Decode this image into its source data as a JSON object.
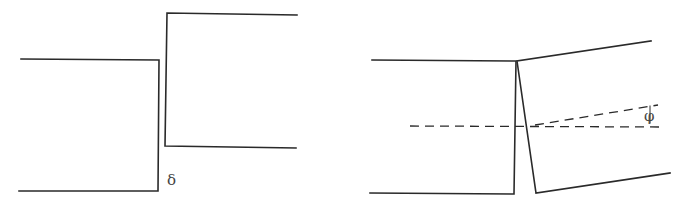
{
  "figures": [
    {
      "id": "shear-displacement",
      "label": "δ",
      "description": "Two blocks offset vertically by a shear displacement δ"
    },
    {
      "id": "rotation",
      "label": "φ",
      "description": "Right block rotated relative to left block by angle φ about the neutral axis (dashed lines)"
    }
  ],
  "colors": {
    "line": "#2a2a2a",
    "background": "#ffffff"
  }
}
